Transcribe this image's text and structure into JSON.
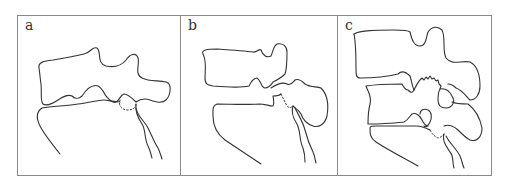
{
  "figure": {
    "panels": [
      {
        "id": "a",
        "label": "a"
      },
      {
        "id": "b",
        "label": "b"
      },
      {
        "id": "c",
        "label": "c"
      }
    ],
    "colors": {
      "line": "#333333",
      "frame": "#8a8a8a",
      "background": "#ffffff"
    }
  }
}
